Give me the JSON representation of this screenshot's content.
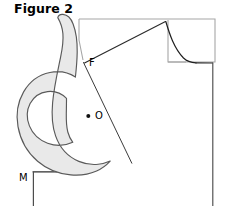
{
  "figure": {
    "title": "Figure 2",
    "caption_position": "top-left",
    "background_color": "#ffffff"
  },
  "labels": [
    {
      "id": "F",
      "text": "F",
      "x": 89,
      "y": 66,
      "marker": false
    },
    {
      "id": "O",
      "text": "O",
      "x": 95,
      "y": 119,
      "marker": true,
      "marker_x": 88,
      "marker_y": 116
    },
    {
      "id": "M",
      "text": "M",
      "x": 19,
      "y": 181,
      "marker": false
    }
  ],
  "colors": {
    "outline_dark": "#3a3a3a",
    "outline_black": "#1a1a1a",
    "outline_gray": "#9a9a9a",
    "hook_fill": "#e9e9e9",
    "hook_stroke": "#4a4a4a",
    "text": "#000000"
  },
  "geometry": {
    "garment_block": {
      "name": "bodice-block-outline",
      "top_left": [
        79,
        19
      ],
      "top_right": [
        215,
        19
      ],
      "right_bottom": [
        215,
        64
      ],
      "neck_corner": [
        168,
        61
      ],
      "shoulder_point": [
        165,
        21
      ]
    },
    "shoulder_line": {
      "from": [
        84,
        62
      ],
      "to": [
        165,
        21
      ]
    },
    "neckline_curve": {
      "from": [
        166,
        22
      ],
      "to": [
        186,
        63
      ],
      "end_h_to": [
        213,
        63
      ]
    },
    "center_front_line": {
      "from": [
        213,
        63
      ],
      "to": [
        213,
        206
      ]
    },
    "hem_line": {
      "from": [
        33,
        172
      ],
      "to": [
        92,
        172
      ]
    },
    "side_seam_line": {
      "from": [
        33,
        172
      ],
      "to": [
        33,
        206
      ]
    },
    "dart_leg_line": {
      "from": [
        84,
        62
      ],
      "to": [
        132,
        163
      ]
    },
    "hook_shape": {
      "name": "scroll-hook-motif",
      "tip": [
        58,
        18
      ],
      "spiral_center": [
        48,
        131
      ],
      "bounds": [
        13,
        17,
        110,
        176
      ]
    }
  }
}
